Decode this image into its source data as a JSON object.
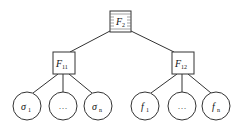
{
  "diagram": {
    "type": "tree",
    "root": {
      "id": "F2",
      "label": "F",
      "subscript": "2",
      "style": "hatched-box"
    },
    "level1": [
      {
        "id": "F11",
        "label": "F",
        "subscript": "11",
        "style": "box"
      },
      {
        "id": "F12",
        "label": "F",
        "subscript": "12",
        "style": "box"
      }
    ],
    "leaves": {
      "F11": [
        {
          "id": "sigma1",
          "label": "σ",
          "subscript": "1"
        },
        {
          "id": "dots-left",
          "label": "…",
          "subscript": ""
        },
        {
          "id": "sigman",
          "label": "σ",
          "subscript": "n"
        }
      ],
      "F12": [
        {
          "id": "f1",
          "label": "f",
          "subscript": "1"
        },
        {
          "id": "dots-right",
          "label": "…",
          "subscript": ""
        },
        {
          "id": "fn",
          "label": "f",
          "subscript": "n"
        }
      ]
    },
    "edges": [
      [
        "F2",
        "F11"
      ],
      [
        "F2",
        "F12"
      ],
      [
        "F11",
        "sigma1"
      ],
      [
        "F11",
        "dots-left"
      ],
      [
        "F11",
        "sigman"
      ],
      [
        "F12",
        "f1"
      ],
      [
        "F12",
        "dots-right"
      ],
      [
        "F12",
        "fn"
      ]
    ]
  }
}
